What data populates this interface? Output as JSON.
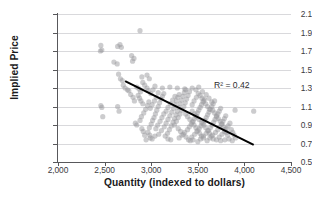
{
  "chart_data": {
    "type": "scatter",
    "title": "",
    "xlabel": "Quantity (indexed to dollars)",
    "ylabel": "Implied Price",
    "xlim": [
      2000,
      4500
    ],
    "ylim": [
      0.5,
      2.1
    ],
    "xticks": [
      2000,
      2500,
      3000,
      3500,
      4000,
      4500
    ],
    "xtick_labels": [
      "2,000",
      "2,500",
      "3,000",
      "3,500",
      "4,000",
      "4,500"
    ],
    "yticks": [
      0.5,
      0.7,
      0.9,
      1.1,
      1.3,
      1.5,
      1.7,
      1.9,
      2.1
    ],
    "ytick_labels": [
      "0.5",
      "0.7",
      "0.9",
      "1.1",
      "1.3",
      "1.5",
      "1.7",
      "1.9",
      "2.1"
    ],
    "grid": "horizontal",
    "legend": "none",
    "annotations": [
      {
        "name": "r-squared",
        "text": "R² = 0.42",
        "x": 4080,
        "y": 1.22
      }
    ],
    "series": [
      {
        "name": "observations",
        "marker": "circle",
        "color": "#9a9a9e",
        "opacity": 0.5,
        "size": 5.2,
        "points": [
          [
            2460,
            1.76
          ],
          [
            2470,
            1.71
          ],
          [
            2455,
            1.7
          ],
          [
            2640,
            1.75
          ],
          [
            2665,
            1.77
          ],
          [
            2680,
            1.74
          ],
          [
            2600,
            1.58
          ],
          [
            2635,
            1.56
          ],
          [
            2790,
            1.65
          ],
          [
            2815,
            1.62
          ],
          [
            2800,
            1.59
          ],
          [
            2880,
            1.92
          ],
          [
            2650,
            1.45
          ],
          [
            2670,
            1.4
          ],
          [
            2690,
            1.38
          ],
          [
            2700,
            1.33
          ],
          [
            2720,
            1.3
          ],
          [
            2745,
            1.28
          ],
          [
            2460,
            1.11
          ],
          [
            2470,
            1.09
          ],
          [
            2480,
            0.99
          ],
          [
            2640,
            1.1
          ],
          [
            2655,
            1.05
          ],
          [
            2845,
            1.31
          ],
          [
            2870,
            1.29
          ],
          [
            2885,
            1.26
          ],
          [
            2900,
            1.42
          ],
          [
            2955,
            1.44
          ],
          [
            2980,
            1.4
          ],
          [
            2860,
            1.22
          ],
          [
            2875,
            1.19
          ],
          [
            2890,
            1.16
          ],
          [
            2910,
            1.13
          ],
          [
            2830,
            0.92
          ],
          [
            2845,
            0.9
          ],
          [
            2900,
            0.86
          ],
          [
            2915,
            0.83
          ],
          [
            2930,
            0.79
          ],
          [
            2965,
            0.82
          ],
          [
            2980,
            0.87
          ],
          [
            3000,
            0.91
          ],
          [
            3015,
            0.95
          ],
          [
            3030,
            0.98
          ],
          [
            3045,
            1.02
          ],
          [
            3060,
            1.06
          ],
          [
            3075,
            1.1
          ],
          [
            3090,
            1.14
          ],
          [
            3105,
            1.18
          ],
          [
            3120,
            1.21
          ],
          [
            3135,
            1.24
          ],
          [
            2945,
            0.74
          ],
          [
            2990,
            0.76
          ],
          [
            3040,
            0.78
          ],
          [
            3080,
            0.8
          ],
          [
            3110,
            0.84
          ],
          [
            3140,
            0.88
          ],
          [
            3160,
            0.92
          ],
          [
            3180,
            0.96
          ],
          [
            3200,
            1.0
          ],
          [
            3220,
            1.04
          ],
          [
            3240,
            1.08
          ],
          [
            3255,
            1.12
          ],
          [
            3270,
            1.16
          ],
          [
            3285,
            1.2
          ],
          [
            3300,
            1.23
          ],
          [
            3150,
            0.78
          ],
          [
            3175,
            0.81
          ],
          [
            3195,
            0.85
          ],
          [
            3215,
            0.89
          ],
          [
            3235,
            0.93
          ],
          [
            3250,
            0.97
          ],
          [
            3265,
            1.01
          ],
          [
            3280,
            1.05
          ],
          [
            3295,
            1.09
          ],
          [
            3310,
            1.13
          ],
          [
            3325,
            1.17
          ],
          [
            3340,
            1.21
          ],
          [
            3355,
            1.25
          ],
          [
            3370,
            1.28
          ],
          [
            3120,
            1.3
          ],
          [
            3200,
            1.31
          ],
          [
            3280,
            1.3
          ],
          [
            3360,
            1.29
          ],
          [
            3440,
            1.3
          ],
          [
            3480,
            1.28
          ],
          [
            3510,
            1.31
          ],
          [
            3550,
            1.26
          ],
          [
            3590,
            1.23
          ],
          [
            3620,
            1.19
          ],
          [
            3650,
            1.15
          ],
          [
            3300,
            0.76
          ],
          [
            3330,
            0.79
          ],
          [
            3360,
            0.82
          ],
          [
            3390,
            0.85
          ],
          [
            3410,
            0.88
          ],
          [
            3430,
            0.91
          ],
          [
            3450,
            0.94
          ],
          [
            3465,
            0.97
          ],
          [
            3480,
            1.0
          ],
          [
            3495,
            1.03
          ],
          [
            3510,
            1.06
          ],
          [
            3525,
            1.09
          ],
          [
            3540,
            1.12
          ],
          [
            3555,
            1.15
          ],
          [
            3570,
            1.18
          ],
          [
            3400,
            0.74
          ],
          [
            3435,
            0.77
          ],
          [
            3465,
            0.8
          ],
          [
            3490,
            0.83
          ],
          [
            3515,
            0.86
          ],
          [
            3535,
            0.89
          ],
          [
            3555,
            0.92
          ],
          [
            3575,
            0.95
          ],
          [
            3590,
            0.98
          ],
          [
            3605,
            1.01
          ],
          [
            3620,
            1.04
          ],
          [
            3635,
            1.07
          ],
          [
            3650,
            1.1
          ],
          [
            3665,
            1.13
          ],
          [
            3680,
            1.16
          ],
          [
            3500,
            0.72
          ],
          [
            3530,
            0.75
          ],
          [
            3560,
            0.78
          ],
          [
            3590,
            0.81
          ],
          [
            3615,
            0.84
          ],
          [
            3635,
            0.87
          ],
          [
            3655,
            0.9
          ],
          [
            3670,
            0.93
          ],
          [
            3685,
            0.96
          ],
          [
            3700,
            0.99
          ],
          [
            3715,
            1.02
          ],
          [
            3730,
            1.05
          ],
          [
            3745,
            1.08
          ],
          [
            3600,
            0.73
          ],
          [
            3630,
            0.76
          ],
          [
            3660,
            0.79
          ],
          [
            3690,
            0.82
          ],
          [
            3715,
            0.85
          ],
          [
            3735,
            0.88
          ],
          [
            3755,
            0.91
          ],
          [
            3770,
            0.94
          ],
          [
            3785,
            0.97
          ],
          [
            3800,
            1.0
          ],
          [
            3700,
            0.74
          ],
          [
            3730,
            0.77
          ],
          [
            3760,
            0.8
          ],
          [
            3785,
            0.83
          ],
          [
            3805,
            0.86
          ],
          [
            3825,
            0.89
          ],
          [
            3845,
            0.92
          ],
          [
            3250,
            0.9
          ],
          [
            3270,
            0.94
          ],
          [
            3290,
            0.98
          ],
          [
            3310,
            1.02
          ],
          [
            3330,
            1.06
          ],
          [
            3350,
            1.1
          ],
          [
            3365,
            1.14
          ],
          [
            3380,
            1.18
          ],
          [
            3395,
            1.22
          ],
          [
            3410,
            1.26
          ],
          [
            3160,
            1.05
          ],
          [
            3180,
            1.09
          ],
          [
            3205,
            1.13
          ],
          [
            3230,
            1.17
          ],
          [
            3255,
            1.21
          ],
          [
            3050,
            0.86
          ],
          [
            3070,
            0.9
          ],
          [
            3095,
            0.94
          ],
          [
            3115,
            0.98
          ],
          [
            3135,
            1.02
          ],
          [
            2990,
            1.08
          ],
          [
            3010,
            1.12
          ],
          [
            3035,
            1.16
          ],
          [
            3055,
            1.2
          ],
          [
            3075,
            1.25
          ],
          [
            3440,
            1.12
          ],
          [
            3460,
            1.16
          ],
          [
            3485,
            1.2
          ],
          [
            3505,
            1.24
          ],
          [
            3525,
            1.22
          ],
          [
            3545,
            1.19
          ],
          [
            3565,
            1.16
          ],
          [
            3585,
            1.13
          ],
          [
            3605,
            1.1
          ],
          [
            3625,
            1.07
          ],
          [
            3370,
            1.02
          ],
          [
            3390,
            0.99
          ],
          [
            3415,
            0.96
          ],
          [
            3440,
            0.93
          ],
          [
            3460,
            0.9
          ],
          [
            3480,
            0.87
          ],
          [
            3500,
            0.84
          ],
          [
            3520,
            0.81
          ],
          [
            3540,
            0.78
          ],
          [
            3560,
            0.76
          ],
          [
            3660,
            1.06
          ],
          [
            3680,
            1.03
          ],
          [
            3700,
            1.0
          ],
          [
            3720,
            0.97
          ],
          [
            3740,
            0.94
          ],
          [
            3760,
            0.91
          ],
          [
            3775,
            0.88
          ],
          [
            3790,
            0.85
          ],
          [
            3805,
            0.82
          ],
          [
            3820,
            0.79
          ],
          [
            3860,
            0.85
          ],
          [
            3875,
            0.82
          ],
          [
            3890,
            0.79
          ],
          [
            3905,
            0.76
          ],
          [
            3745,
            0.73
          ],
          [
            3790,
            0.74
          ],
          [
            3835,
            0.75
          ],
          [
            3870,
            0.73
          ],
          [
            3900,
            1.06
          ],
          [
            4100,
            1.05
          ],
          [
            2760,
            1.27
          ],
          [
            2780,
            1.23
          ],
          [
            2805,
            1.2
          ],
          [
            2820,
            1.16
          ],
          [
            2955,
            1.3
          ],
          [
            2970,
            1.27
          ],
          [
            2995,
            1.24
          ],
          [
            3020,
            1.28
          ],
          [
            3040,
            1.32
          ],
          [
            2910,
            1.36
          ],
          [
            2930,
            1.33
          ],
          [
            3420,
            0.73
          ],
          [
            3450,
            0.74
          ],
          [
            3180,
            0.75
          ],
          [
            3210,
            0.74
          ],
          [
            2985,
            0.79
          ],
          [
            3010,
            0.75
          ],
          [
            2880,
            0.95
          ],
          [
            2895,
            0.99
          ],
          [
            2920,
            1.03
          ],
          [
            2940,
            1.07
          ],
          [
            2960,
            1.11
          ],
          [
            2975,
            1.15
          ],
          [
            3440,
            1.05
          ],
          [
            3465,
            1.02
          ],
          [
            3490,
            0.99
          ],
          [
            3515,
            0.96
          ],
          [
            3540,
            0.93
          ],
          [
            3565,
            0.9
          ],
          [
            3585,
            0.87
          ],
          [
            3605,
            0.84
          ],
          [
            3625,
            0.81
          ],
          [
            3645,
            0.78
          ],
          [
            3665,
            0.75
          ],
          [
            3290,
            0.86
          ],
          [
            3315,
            0.83
          ],
          [
            3345,
            0.8
          ],
          [
            3375,
            0.77
          ]
        ]
      }
    ],
    "trendline": {
      "name": "linear-fit",
      "color": "#000000",
      "width": 2.0,
      "x_start": 2720,
      "y_start": 1.375,
      "x_end": 4100,
      "y_end": 0.685
    }
  }
}
